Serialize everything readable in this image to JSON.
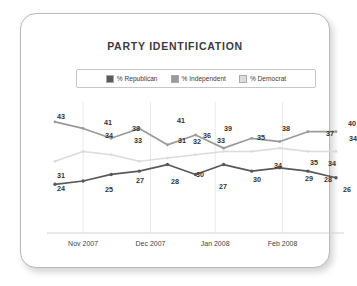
{
  "card": {
    "title": "PARTY IDENTIFICATION"
  },
  "legend": {
    "items": [
      {
        "label": "% Republican",
        "color": "#595959",
        "key": "republican"
      },
      {
        "label": "% Independent",
        "color": "#9a9a9a",
        "key": "independent"
      },
      {
        "label": "% Democrat",
        "color": "#dcdcdc",
        "key": "democrat"
      }
    ]
  },
  "axis": {
    "ticks": [
      "Nov 2007",
      "Dec 2007",
      "Jan 2008",
      "Feb 2008"
    ]
  },
  "chart_data": {
    "type": "line",
    "title": "PARTY IDENTIFICATION",
    "xlabel": "",
    "ylabel": "",
    "ylim": [
      18,
      46
    ],
    "grid": "vertical",
    "legend_position": "top-center",
    "x": [
      0,
      1,
      2,
      3,
      4,
      5,
      6,
      7,
      8,
      9,
      10
    ],
    "tick_labels": [
      "Nov 2007",
      "Dec 2007",
      "Jan 2008",
      "Feb 2008"
    ],
    "tick_positions": [
      1.0,
      3.4,
      5.7,
      8.1
    ],
    "series": [
      {
        "name": "% Republican",
        "color": "#595959",
        "values": [
          24,
          25,
          27,
          28,
          30,
          27,
          30,
          28,
          29,
          28,
          26
        ],
        "labels": [
          "24",
          "25",
          "27",
          "28",
          "30",
          "27",
          "30",
          "28",
          "29",
          "28",
          "26"
        ]
      },
      {
        "name": "% Independent",
        "color": "#9a9a9a",
        "values": [
          43,
          41,
          38,
          41,
          36,
          39,
          35,
          38,
          37,
          40,
          40
        ],
        "labels": [
          "43",
          "41",
          "38",
          "41",
          "36",
          "39",
          "35",
          "38",
          "37",
          "40",
          ""
        ]
      },
      {
        "name": "% Democrat",
        "color": "#dcdcdc",
        "values": [
          31,
          34,
          33,
          31,
          32,
          33,
          34,
          34,
          35,
          34,
          34
        ],
        "labels": [
          "31",
          "34",
          "33",
          "31",
          "32",
          "33",
          "34",
          "34",
          "35",
          "34",
          "34"
        ]
      }
    ]
  },
  "labels": {
    "republican": [
      {
        "text": "24",
        "x": 14,
        "y": 86
      },
      {
        "text": "25",
        "x": 62,
        "y": 87
      },
      {
        "text": "27",
        "x": 93,
        "y": 78
      },
      {
        "text": "28",
        "x": 128,
        "y": 79
      },
      {
        "text": "30",
        "x": 153,
        "y": 72
      },
      {
        "text": "27",
        "x": 176,
        "y": 84
      },
      {
        "text": "30",
        "x": 210,
        "y": 77
      },
      {
        "text": "34",
        "x": 231,
        "y": 63
      },
      {
        "text": "29",
        "x": 262,
        "y": 76
      },
      {
        "text": "28",
        "x": 281,
        "y": 77
      },
      {
        "text": "26",
        "x": 300,
        "y": 87
      }
    ],
    "independent": [
      {
        "text": "43",
        "x": 14,
        "y": 14
      },
      {
        "text": "41",
        "x": 61,
        "y": 20
      },
      {
        "text": "38",
        "x": 89,
        "y": 26
      },
      {
        "text": "41",
        "x": 134,
        "y": 18
      },
      {
        "text": "36",
        "x": 160,
        "y": 33
      },
      {
        "text": "39",
        "x": 181,
        "y": 26
      },
      {
        "text": "35",
        "x": 214,
        "y": 35
      },
      {
        "text": "38",
        "x": 239,
        "y": 26
      },
      {
        "text": "37",
        "x": 283,
        "y": 31
      },
      {
        "text": "40",
        "x": 305,
        "y": 21
      }
    ],
    "democrat": [
      {
        "text": "31",
        "x": 14,
        "y": 73
      },
      {
        "text": "34",
        "x": 62,
        "y": 33
      },
      {
        "text": "33",
        "x": 91,
        "y": 38
      },
      {
        "text": "31",
        "x": 135,
        "y": 38
      },
      {
        "text": "32",
        "x": 150,
        "y": 39
      },
      {
        "text": "33",
        "x": 174,
        "y": 38
      },
      {
        "text": "35",
        "x": 267,
        "y": 60
      },
      {
        "text": "34",
        "x": 285,
        "y": 61
      },
      {
        "text": "34",
        "x": 306,
        "y": 36
      }
    ]
  }
}
